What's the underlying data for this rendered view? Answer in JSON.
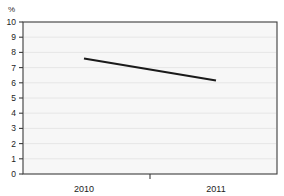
{
  "chart_data": {
    "type": "line",
    "title": "",
    "xlabel": "",
    "ylabel": "%",
    "unit_label": "%",
    "categories": [
      "2010",
      "2011"
    ],
    "x": [
      2010,
      2011
    ],
    "series": [
      {
        "name": "",
        "values": [
          7.6,
          6.15
        ]
      }
    ],
    "ylim": [
      0,
      10
    ],
    "ytick_labels": [
      "10",
      "9",
      "8",
      "7",
      "6",
      "5",
      "4",
      "3",
      "2",
      "1",
      "0"
    ],
    "ytick_values": [
      10,
      9,
      8,
      7,
      6,
      5,
      4,
      3,
      2,
      1,
      0
    ],
    "xtick_labels": [
      "2010",
      "2011"
    ],
    "grid": true,
    "legend": false,
    "line_color": "#1a1a1a",
    "plot_background": "#f7f7f7",
    "grid_color": "#e6e6e6",
    "axis_color": "#3c3c3c"
  }
}
